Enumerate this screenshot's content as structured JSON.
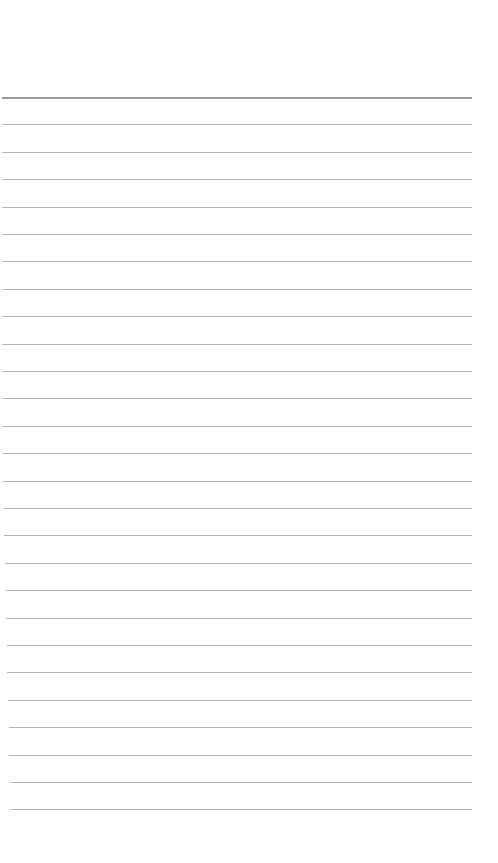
{
  "paper": {
    "type": "lined-paper",
    "background_color": "#ffffff",
    "line_color": "#9a9a9a",
    "line_count": 27,
    "first_line_y": 97,
    "line_spacing": 27.4,
    "line_left": 2,
    "line_right": 472,
    "text": ""
  }
}
